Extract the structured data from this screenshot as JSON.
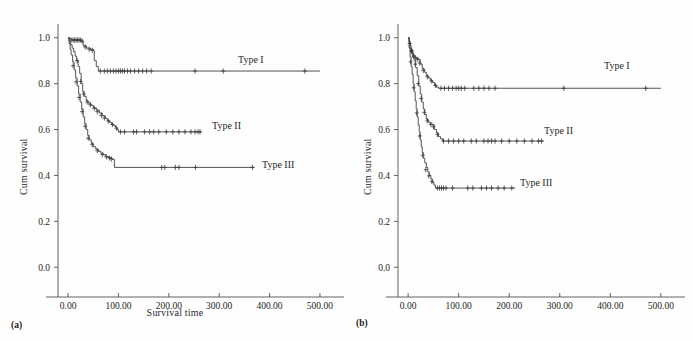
{
  "figure": {
    "background_color": "#fefefe",
    "line_color": "#3a3634",
    "axis_color": "#55504e",
    "text_color": "#231f20"
  },
  "panels": [
    {
      "caption": "(a)",
      "ylabel": "Cum survival",
      "xlabel": "Survival time",
      "xticks": [
        "0.00",
        "100.00",
        "200.00",
        "300.00",
        "400.00",
        "500.00"
      ],
      "yticks": [
        "0.0",
        "0.2",
        "0.4",
        "0.6",
        "0.8",
        "1.0"
      ],
      "series_labels": [
        "Type I",
        "Type II",
        "Type III"
      ]
    },
    {
      "caption": "(b)",
      "ylabel": "Cum survival",
      "xlabel": "",
      "xticks": [
        "0.00",
        "100.00",
        "200.00",
        "300.00",
        "400.00",
        "500.00"
      ],
      "yticks": [
        "0.0",
        "0.2",
        "0.4",
        "0.6",
        "0.8",
        "1.0"
      ],
      "series_labels": [
        "Type I",
        "Type II",
        "Type III"
      ]
    }
  ],
  "chart_data": [
    {
      "type": "line",
      "title": "(a)",
      "xlabel": "Survival time",
      "ylabel": "Cum survival",
      "xlim": [
        -20,
        520
      ],
      "ylim": [
        -0.06,
        1.06
      ],
      "xticks": [
        0,
        100,
        200,
        300,
        400,
        500
      ],
      "yticks": [
        0.0,
        0.2,
        0.4,
        0.6,
        0.8,
        1.0
      ],
      "grid": false,
      "legend": "inline-right-of-curve",
      "series": [
        {
          "name": "Type I",
          "plateau": 0.855,
          "steps": [
            [
              0,
              1.0
            ],
            [
              3,
              0.995
            ],
            [
              8,
              0.99
            ],
            [
              14,
              0.99
            ],
            [
              20,
              0.99
            ],
            [
              26,
              0.985
            ],
            [
              30,
              0.965
            ],
            [
              36,
              0.955
            ],
            [
              44,
              0.95
            ],
            [
              50,
              0.945
            ],
            [
              52,
              0.9
            ],
            [
              56,
              0.875
            ],
            [
              60,
              0.855
            ],
            [
              500,
              0.855
            ]
          ],
          "censor_x": [
            6,
            10,
            13,
            16,
            19,
            22,
            25,
            28,
            34,
            42,
            48,
            64,
            72,
            78,
            84,
            90,
            95,
            100,
            104,
            108,
            112,
            118,
            124,
            132,
            140,
            148,
            156,
            165,
            252,
            308,
            470
          ],
          "censor_y": [
            0.99,
            0.99,
            0.99,
            0.99,
            0.99,
            0.99,
            0.99,
            0.985,
            0.96,
            0.95,
            0.945,
            0.855,
            0.855,
            0.855,
            0.855,
            0.855,
            0.855,
            0.855,
            0.855,
            0.855,
            0.855,
            0.855,
            0.855,
            0.855,
            0.855,
            0.855,
            0.855,
            0.855,
            0.855,
            0.855,
            0.855
          ]
        },
        {
          "name": "Type II",
          "plateau": 0.59,
          "steps": [
            [
              0,
              1.0
            ],
            [
              2,
              0.985
            ],
            [
              5,
              0.97
            ],
            [
              8,
              0.955
            ],
            [
              11,
              0.94
            ],
            [
              14,
              0.92
            ],
            [
              17,
              0.9
            ],
            [
              20,
              0.875
            ],
            [
              23,
              0.845
            ],
            [
              26,
              0.8
            ],
            [
              29,
              0.765
            ],
            [
              32,
              0.745
            ],
            [
              36,
              0.725
            ],
            [
              40,
              0.715
            ],
            [
              45,
              0.705
            ],
            [
              50,
              0.695
            ],
            [
              56,
              0.685
            ],
            [
              62,
              0.672
            ],
            [
              68,
              0.66
            ],
            [
              74,
              0.648
            ],
            [
              78,
              0.64
            ],
            [
              82,
              0.632
            ],
            [
              86,
              0.624
            ],
            [
              90,
              0.617
            ],
            [
              94,
              0.61
            ],
            [
              97,
              0.6
            ],
            [
              100,
              0.59
            ],
            [
              265,
              0.59
            ]
          ],
          "censor_x": [
            18,
            25,
            31,
            38,
            44,
            52,
            58,
            66,
            72,
            80,
            88,
            96,
            104,
            112,
            130,
            136,
            152,
            162,
            170,
            180,
            195,
            208,
            220,
            232,
            244,
            252,
            258,
            262
          ],
          "censor_y": [
            0.9,
            0.81,
            0.755,
            0.72,
            0.708,
            0.693,
            0.678,
            0.662,
            0.65,
            0.637,
            0.622,
            0.606,
            0.59,
            0.59,
            0.59,
            0.59,
            0.59,
            0.59,
            0.59,
            0.59,
            0.59,
            0.59,
            0.59,
            0.59,
            0.59,
            0.59,
            0.59,
            0.59
          ]
        },
        {
          "name": "Type III",
          "plateau": 0.435,
          "steps": [
            [
              0,
              1.0
            ],
            [
              2,
              0.975
            ],
            [
              4,
              0.95
            ],
            [
              6,
              0.925
            ],
            [
              9,
              0.895
            ],
            [
              12,
              0.86
            ],
            [
              15,
              0.825
            ],
            [
              18,
              0.79
            ],
            [
              21,
              0.755
            ],
            [
              24,
              0.72
            ],
            [
              27,
              0.69
            ],
            [
              30,
              0.655
            ],
            [
              33,
              0.625
            ],
            [
              36,
              0.6
            ],
            [
              39,
              0.575
            ],
            [
              42,
              0.555
            ],
            [
              46,
              0.54
            ],
            [
              50,
              0.525
            ],
            [
              55,
              0.515
            ],
            [
              60,
              0.505
            ],
            [
              65,
              0.497
            ],
            [
              70,
              0.49
            ],
            [
              75,
              0.482
            ],
            [
              80,
              0.478
            ],
            [
              85,
              0.474
            ],
            [
              88,
              0.47
            ],
            [
              92,
              0.435
            ],
            [
              370,
              0.435
            ]
          ],
          "censor_x": [
            10,
            16,
            22,
            28,
            34,
            40,
            48,
            58,
            68,
            76,
            82,
            86,
            186,
            192,
            213,
            220,
            253,
            366
          ],
          "censor_y": [
            0.878,
            0.808,
            0.74,
            0.678,
            0.614,
            0.562,
            0.534,
            0.508,
            0.491,
            0.481,
            0.476,
            0.472,
            0.435,
            0.435,
            0.435,
            0.435,
            0.435,
            0.435
          ]
        }
      ]
    },
    {
      "type": "line",
      "title": "(b)",
      "xlabel": "",
      "ylabel": "Cum survival",
      "xlim": [
        -20,
        520
      ],
      "ylim": [
        -0.06,
        1.06
      ],
      "xticks": [
        0,
        100,
        200,
        300,
        400,
        500
      ],
      "yticks": [
        0.0,
        0.2,
        0.4,
        0.6,
        0.8,
        1.0
      ],
      "grid": false,
      "legend": "inline-right-of-curve",
      "series": [
        {
          "name": "Type I",
          "plateau": 0.78,
          "steps": [
            [
              0,
              1.0
            ],
            [
              2,
              0.985
            ],
            [
              4,
              0.965
            ],
            [
              6,
              0.95
            ],
            [
              8,
              0.935
            ],
            [
              10,
              0.925
            ],
            [
              13,
              0.915
            ],
            [
              16,
              0.91
            ],
            [
              20,
              0.905
            ],
            [
              24,
              0.885
            ],
            [
              28,
              0.865
            ],
            [
              32,
              0.85
            ],
            [
              36,
              0.835
            ],
            [
              40,
              0.825
            ],
            [
              44,
              0.815
            ],
            [
              48,
              0.805
            ],
            [
              52,
              0.795
            ],
            [
              56,
              0.785
            ],
            [
              60,
              0.78
            ],
            [
              500,
              0.78
            ]
          ],
          "censor_x": [
            3,
            7,
            11,
            15,
            19,
            23,
            30,
            38,
            46,
            54,
            65,
            72,
            80,
            88,
            95,
            100,
            105,
            112,
            130,
            140,
            150,
            160,
            172,
            308,
            470
          ],
          "censor_y": [
            0.975,
            0.94,
            0.92,
            0.912,
            0.906,
            0.89,
            0.858,
            0.83,
            0.812,
            0.792,
            0.78,
            0.78,
            0.78,
            0.78,
            0.78,
            0.78,
            0.78,
            0.78,
            0.78,
            0.78,
            0.78,
            0.78,
            0.78,
            0.78,
            0.78
          ]
        },
        {
          "name": "Type II",
          "plateau": 0.55,
          "steps": [
            [
              0,
              1.0
            ],
            [
              2,
              0.98
            ],
            [
              4,
              0.955
            ],
            [
              6,
              0.935
            ],
            [
              9,
              0.915
            ],
            [
              12,
              0.9
            ],
            [
              15,
              0.87
            ],
            [
              18,
              0.835
            ],
            [
              21,
              0.79
            ],
            [
              24,
              0.755
            ],
            [
              27,
              0.72
            ],
            [
              30,
              0.69
            ],
            [
              33,
              0.665
            ],
            [
              36,
              0.645
            ],
            [
              40,
              0.632
            ],
            [
              44,
              0.625
            ],
            [
              48,
              0.62
            ],
            [
              52,
              0.6
            ],
            [
              56,
              0.585
            ],
            [
              60,
              0.57
            ],
            [
              64,
              0.56
            ],
            [
              68,
              0.55
            ],
            [
              268,
              0.55
            ]
          ],
          "censor_x": [
            7,
            14,
            20,
            26,
            32,
            38,
            45,
            50,
            58,
            70,
            80,
            90,
            100,
            110,
            125,
            135,
            150,
            158,
            165,
            172,
            185,
            200,
            215,
            230,
            245,
            258,
            264
          ],
          "censor_y": [
            0.945,
            0.885,
            0.8,
            0.735,
            0.675,
            0.638,
            0.622,
            0.612,
            0.578,
            0.55,
            0.55,
            0.55,
            0.55,
            0.55,
            0.55,
            0.55,
            0.55,
            0.55,
            0.55,
            0.55,
            0.55,
            0.55,
            0.55,
            0.55,
            0.55,
            0.55,
            0.55
          ]
        },
        {
          "name": "Type III",
          "plateau": 0.345,
          "steps": [
            [
              0,
              1.0
            ],
            [
              2,
              0.955
            ],
            [
              4,
              0.915
            ],
            [
              6,
              0.875
            ],
            [
              8,
              0.84
            ],
            [
              10,
              0.8
            ],
            [
              12,
              0.765
            ],
            [
              14,
              0.725
            ],
            [
              16,
              0.69
            ],
            [
              18,
              0.655
            ],
            [
              20,
              0.62
            ],
            [
              22,
              0.59
            ],
            [
              24,
              0.555
            ],
            [
              26,
              0.525
            ],
            [
              28,
              0.5
            ],
            [
              30,
              0.475
            ],
            [
              33,
              0.455
            ],
            [
              36,
              0.435
            ],
            [
              39,
              0.415
            ],
            [
              42,
              0.4
            ],
            [
              45,
              0.385
            ],
            [
              48,
              0.37
            ],
            [
              51,
              0.358
            ],
            [
              54,
              0.345
            ],
            [
              212,
              0.345
            ]
          ],
          "censor_x": [
            5,
            11,
            17,
            23,
            29,
            35,
            41,
            47,
            58,
            62,
            66,
            70,
            75,
            88,
            118,
            128,
            145,
            155,
            165,
            178,
            190,
            205
          ],
          "censor_y": [
            0.895,
            0.782,
            0.672,
            0.572,
            0.488,
            0.425,
            0.398,
            0.373,
            0.345,
            0.345,
            0.345,
            0.345,
            0.345,
            0.345,
            0.345,
            0.345,
            0.345,
            0.345,
            0.345,
            0.345,
            0.345,
            0.345
          ]
        }
      ]
    }
  ]
}
